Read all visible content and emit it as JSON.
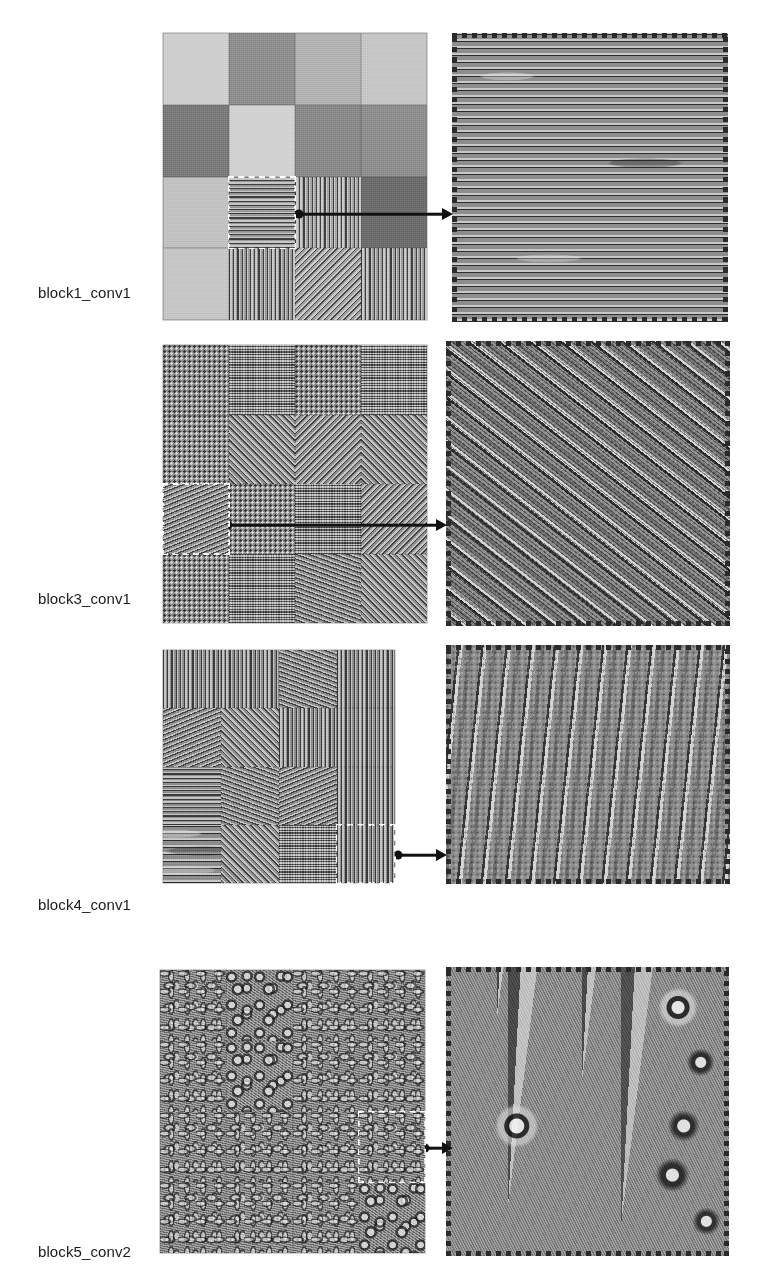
{
  "figure": {
    "type": "cnn-filter-visualization-grid",
    "background": "#ffffff",
    "width": 762,
    "height": 1284,
    "rows": [
      {
        "id": "row-block1-conv1",
        "label": "block1_conv1",
        "label_x": 38,
        "label_y": 284,
        "grid": {
          "x": 163,
          "y": 33,
          "w": 264,
          "h": 287,
          "cols": 4,
          "rows": 4
        },
        "selected_cell": {
          "row": 3,
          "col": 2
        },
        "panel": {
          "x": 452,
          "y": 33,
          "w": 276,
          "h": 289
        },
        "panel_pattern": "horizontal-wavy-lines",
        "connector": {
          "x": 299,
          "y": 214,
          "length": 153
        },
        "cells": [
          {
            "tex": "flat",
            "tone": "#cfcfcf"
          },
          {
            "tex": "flat",
            "tone": "#8f8f8f"
          },
          {
            "tex": "flat",
            "tone": "#b4b4b4"
          },
          {
            "tex": "flat",
            "tone": "#c6c6c6"
          },
          {
            "tex": "flat",
            "tone": "#7b7b7b"
          },
          {
            "tex": "flat",
            "tone": "#d2d2d2"
          },
          {
            "tex": "flat",
            "tone": "#8a8a8a"
          },
          {
            "tex": "flat",
            "tone": "#8f8f8f"
          },
          {
            "tex": "flat",
            "tone": "#c2c2c2"
          },
          {
            "tex": "stripes-h",
            "tone": "#9a9a9a"
          },
          {
            "tex": "stripes-v",
            "tone": "#a6a6a6"
          },
          {
            "tex": "flat",
            "tone": "#6d6d6d"
          },
          {
            "tex": "flat",
            "tone": "#c6c6c6"
          },
          {
            "tex": "stripes-v",
            "tone": "#9c9c9c"
          },
          {
            "tex": "stripes-d2",
            "tone": "#a2a2a2"
          },
          {
            "tex": "stripes-v",
            "tone": "#9f9f9f"
          }
        ]
      },
      {
        "id": "row-block3-conv1",
        "label": "block3_conv1",
        "label_x": 38,
        "label_y": 590,
        "grid": {
          "x": 163,
          "y": 345,
          "w": 264,
          "h": 278,
          "cols": 4,
          "rows": 4
        },
        "selected_cell": {
          "row": 3,
          "col": 1
        },
        "panel": {
          "x": 446,
          "y": 341,
          "w": 284,
          "h": 285
        },
        "panel_pattern": "diagonal-wave-bands",
        "connector": {
          "x": 228,
          "y": 525,
          "length": 218
        },
        "cells": [
          {
            "tex": "dots-fine",
            "tone": "#8e8e8e"
          },
          {
            "tex": "checker-fine",
            "tone": "#909090"
          },
          {
            "tex": "dots-fine",
            "tone": "#8c8c8c"
          },
          {
            "tex": "checker-fine",
            "tone": "#8f8f8f"
          },
          {
            "tex": "dots-fine",
            "tone": "#919191"
          },
          {
            "tex": "stripes-d1",
            "tone": "#8d8d8d"
          },
          {
            "tex": "stripes-d2",
            "tone": "#8e8e8e"
          },
          {
            "tex": "stripes-d1",
            "tone": "#8c8c8c"
          },
          {
            "tex": "stripes-d4",
            "tone": "#8f8f8f"
          },
          {
            "tex": "dots-fine",
            "tone": "#8e8e8e"
          },
          {
            "tex": "checker-fine",
            "tone": "#8d8d8d"
          },
          {
            "tex": "stripes-d2",
            "tone": "#8e8e8e"
          },
          {
            "tex": "dots-fine",
            "tone": "#8d8d8d"
          },
          {
            "tex": "checker-fine",
            "tone": "#8f8f8f"
          },
          {
            "tex": "stripes-d3",
            "tone": "#8c8c8c"
          },
          {
            "tex": "stripes-d1",
            "tone": "#8e8e8e"
          }
        ]
      },
      {
        "id": "row-block4-conv1",
        "label": "block4_conv1",
        "label_x": 38,
        "label_y": 896,
        "grid": {
          "x": 163,
          "y": 650,
          "w": 232,
          "h": 233,
          "cols": 4,
          "rows": 4
        },
        "selected_cell": {
          "row": 4,
          "col": 4
        },
        "panel": {
          "x": 446,
          "y": 645,
          "w": 284,
          "h": 239
        },
        "panel_pattern": "vertical-wave-ridges",
        "connector": {
          "x": 398,
          "y": 855,
          "length": 48
        },
        "cells": [
          {
            "tex": "stripes-v",
            "tone": "#8f8f8f"
          },
          {
            "tex": "stripes-v",
            "tone": "#8d8d8d"
          },
          {
            "tex": "stripes-d3",
            "tone": "#8e8e8e"
          },
          {
            "tex": "stripes-v",
            "tone": "#8c8c8c"
          },
          {
            "tex": "stripes-d4",
            "tone": "#8e8e8e"
          },
          {
            "tex": "stripes-d1",
            "tone": "#8f8f8f"
          },
          {
            "tex": "stripes-v",
            "tone": "#8d8d8d"
          },
          {
            "tex": "stripes-v",
            "tone": "#8e8e8e"
          },
          {
            "tex": "stripes-h",
            "tone": "#8f8f8f"
          },
          {
            "tex": "stripes-d3",
            "tone": "#8d8d8d"
          },
          {
            "tex": "stripes-d4",
            "tone": "#8e8e8e"
          },
          {
            "tex": "stripes-v",
            "tone": "#8c8c8c"
          },
          {
            "tex": "wavy-h",
            "tone": "#8d8d8d"
          },
          {
            "tex": "stripes-d1",
            "tone": "#8f8f8f"
          },
          {
            "tex": "checker-fine",
            "tone": "#8e8e8e"
          },
          {
            "tex": "stripes-v",
            "tone": "#8c8c8c"
          }
        ]
      },
      {
        "id": "row-block5-conv2",
        "label": "block5_conv2",
        "label_x": 38,
        "label_y": 1243,
        "grid": {
          "x": 160,
          "y": 970,
          "w": 265,
          "h": 283,
          "cols": 4,
          "rows": 4
        },
        "selected_cell": {
          "row": 3,
          "col": 4
        },
        "panel": {
          "x": 446,
          "y": 967,
          "w": 283,
          "h": 289
        },
        "panel_pattern": "ornate-radial-medallions",
        "connector": {
          "x": 425,
          "y": 1148,
          "length": 27
        },
        "cells": [
          {
            "tex": "curly",
            "tone": "#8e8e8e"
          },
          {
            "tex": "blobs",
            "tone": "#8d8d8d"
          },
          {
            "tex": "curly",
            "tone": "#8f8f8f"
          },
          {
            "tex": "curly",
            "tone": "#8c8c8c"
          },
          {
            "tex": "curly",
            "tone": "#8e8e8e"
          },
          {
            "tex": "blobs",
            "tone": "#909090"
          },
          {
            "tex": "curly",
            "tone": "#8d8d8d"
          },
          {
            "tex": "curly",
            "tone": "#8e8e8e"
          },
          {
            "tex": "curly",
            "tone": "#8f8f8f"
          },
          {
            "tex": "curly",
            "tone": "#8d8d8d"
          },
          {
            "tex": "curly",
            "tone": "#8e8e8e"
          },
          {
            "tex": "curly",
            "tone": "#8c8c8c"
          },
          {
            "tex": "curly",
            "tone": "#8d8d8d"
          },
          {
            "tex": "curly",
            "tone": "#8f8f8f"
          },
          {
            "tex": "curly",
            "tone": "#8e8e8e"
          },
          {
            "tex": "blobs",
            "tone": "#8d8d8d"
          }
        ]
      }
    ]
  }
}
